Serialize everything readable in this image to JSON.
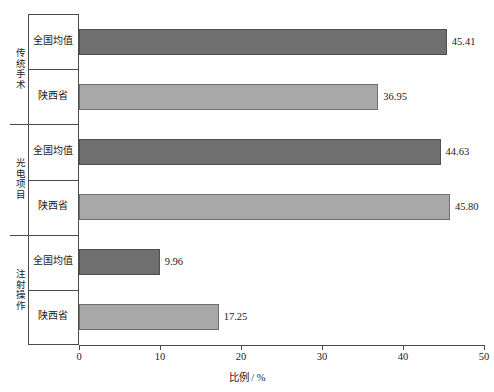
{
  "chart_data": {
    "type": "bar",
    "orientation": "horizontal",
    "title": "",
    "xlabel": "比例 / %",
    "ylabel": "",
    "xlim": [
      0,
      50
    ],
    "xticks": [
      "0",
      "10",
      "20",
      "30",
      "40",
      "50"
    ],
    "grid": false,
    "legend": "none",
    "categories": [
      "全国均值",
      "陕西省"
    ],
    "groups": [
      {
        "name": "传统手术",
        "bars": [
          {
            "category": "全国均值",
            "value": 45.41,
            "label": "45.41",
            "series": 0
          },
          {
            "category": "陕西省",
            "value": 36.95,
            "label": "36.95",
            "series": 1
          }
        ]
      },
      {
        "name": "光电项目",
        "bars": [
          {
            "category": "全国均值",
            "value": 44.63,
            "label": "44.63",
            "series": 0
          },
          {
            "category": "陕西省",
            "value": 45.8,
            "label": "45.80",
            "series": 1
          }
        ]
      },
      {
        "name": "注射操作",
        "bars": [
          {
            "category": "全国均值",
            "value": 9.96,
            "label": "9.96",
            "series": 0
          },
          {
            "category": "陕西省",
            "value": 17.25,
            "label": "17.25",
            "series": 1
          }
        ]
      }
    ],
    "series_colors": {
      "全国均值": "#6f6f6f",
      "陕西省": "#a8a8a8"
    },
    "colors": {
      "axis": "#4a4a4a",
      "text": "#1a1a1a",
      "background": "#ffffff"
    }
  }
}
